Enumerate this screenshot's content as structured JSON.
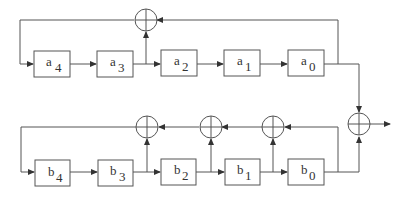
{
  "diagram": {
    "type": "block-diagram",
    "top_register": {
      "blocks": [
        {
          "base": "a",
          "sub": "4"
        },
        {
          "base": "a",
          "sub": "3"
        },
        {
          "base": "a",
          "sub": "2"
        },
        {
          "base": "a",
          "sub": "1"
        },
        {
          "base": "a",
          "sub": "0"
        }
      ],
      "adders": 1
    },
    "bottom_register": {
      "blocks": [
        {
          "base": "b",
          "sub": "4"
        },
        {
          "base": "b",
          "sub": "3"
        },
        {
          "base": "b",
          "sub": "2"
        },
        {
          "base": "b",
          "sub": "1"
        },
        {
          "base": "b",
          "sub": "0"
        }
      ],
      "adders": 3
    },
    "output_adder": 1,
    "colors": {
      "line": "#555555",
      "text": "#333333",
      "background": "#ffffff"
    }
  }
}
